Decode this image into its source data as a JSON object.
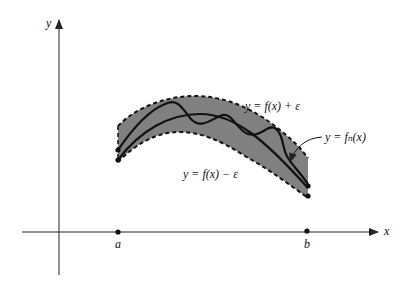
{
  "diagram": {
    "type": "uniform-convergence-band",
    "axes": {
      "x_label": "x",
      "y_label": "y"
    },
    "points": {
      "a_label": "a",
      "b_label": "b"
    },
    "labels": {
      "upper_band": "y = f(x) + ε",
      "lower_band": "y = f(x) − ε",
      "fn_curve": "y = fₙ(x)"
    },
    "colors": {
      "band_fill": "#808080",
      "curve": "#111111",
      "axis": "#222222",
      "background": "#ffffff"
    }
  }
}
